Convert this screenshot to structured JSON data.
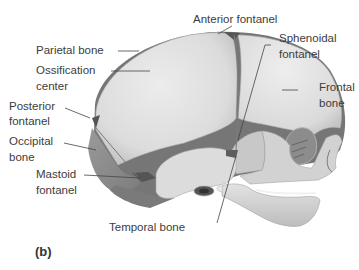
{
  "figure": {
    "panel_label": "(b)",
    "labels": {
      "anterior_fontanel": "Anterior fontanel",
      "parietal_bone": "Parietal bone",
      "ossification_center_1": "Ossification",
      "ossification_center_2": "center",
      "posterior_fontanel_1": "Posterior",
      "posterior_fontanel_2": "fontanel",
      "occipital_bone_1": "Occipital",
      "occipital_bone_2": "bone",
      "mastoid_fontanel_1": "Mastoid",
      "mastoid_fontanel_2": "fontanel",
      "temporal_bone": "Temporal bone",
      "sphenoidal_fontanel_1": "Sphenoidal",
      "sphenoidal_fontanel_2": "fontanel",
      "frontal_bone_1": "Frontal",
      "frontal_bone_2": "bone"
    },
    "colors": {
      "bone_light": "#e6e6e6",
      "bone_mid": "#cfcfcf",
      "bone_dark": "#8f8f8f",
      "fontanel": "#6e6e6e",
      "leader_line": "#444444"
    }
  }
}
